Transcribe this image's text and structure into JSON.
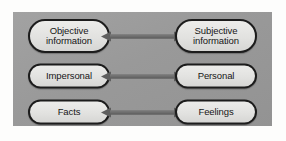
{
  "figure": {
    "panel_color": "#9c9c9c",
    "pill_fill": "#e2e2e0",
    "pill_border": "#1c1c1c",
    "arrow_color": "#5f5f5f",
    "rows": [
      {
        "left": {
          "name": "objective",
          "line1": "Objective",
          "line2": "information"
        },
        "right": {
          "name": "subjective",
          "line1": "Subjective",
          "line2": "information"
        },
        "connector": "double-headed-arrow"
      },
      {
        "left": {
          "name": "impersonal",
          "line1": "Impersonal",
          "line2": ""
        },
        "right": {
          "name": "personal",
          "line1": "Personal",
          "line2": ""
        },
        "connector": "double-headed-arrow"
      },
      {
        "left": {
          "name": "facts",
          "line1": "Facts",
          "line2": ""
        },
        "right": {
          "name": "feelings",
          "line1": "Feelings",
          "line2": ""
        },
        "connector": "double-headed-arrow"
      }
    ]
  }
}
